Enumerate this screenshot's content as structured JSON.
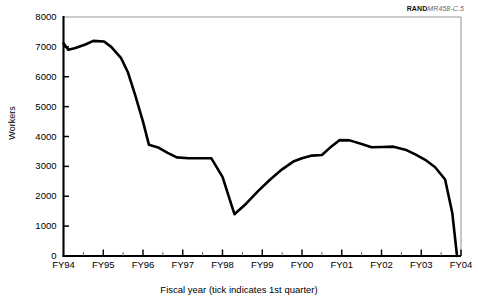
{
  "figure": {
    "source_credit_mark": "RAND",
    "source_credit_id": "MR458-C.5"
  },
  "chart_data": {
    "type": "line",
    "title": "",
    "xlabel": "Fiscal year (tick indicates 1st quarter)",
    "ylabel": "Workers",
    "xlim": [
      1994.0,
      2004.0
    ],
    "ylim": [
      0,
      8000
    ],
    "grid": false,
    "legend": null,
    "x_tick_labels": [
      "FY94",
      "FY95",
      "FY96",
      "FY97",
      "FY98",
      "FY99",
      "FY00",
      "FY01",
      "FY02",
      "FY03",
      "FY04"
    ],
    "x_tick_values": [
      1994,
      1995,
      1996,
      1997,
      1998,
      1999,
      2000,
      2001,
      2002,
      2003,
      2004
    ],
    "y_tick_labels": [
      "0",
      "1000",
      "2000",
      "3000",
      "4000",
      "5000",
      "6000",
      "7000",
      "8000"
    ],
    "y_tick_values": [
      0,
      1000,
      2000,
      3000,
      4000,
      5000,
      6000,
      7000,
      8000
    ],
    "minor_x_ticks_per_interval": 1,
    "series": [
      {
        "name": "Workers",
        "color": "#000000",
        "x": [
          1994.0,
          1994.12,
          1994.3,
          1994.55,
          1994.75,
          1995.02,
          1995.2,
          1995.45,
          1995.62,
          1995.8,
          1996.0,
          1996.15,
          1996.4,
          1996.62,
          1996.85,
          1997.15,
          1997.45,
          1997.72,
          1998.0,
          1998.3,
          1998.6,
          1998.9,
          1999.2,
          1999.5,
          1999.78,
          2000.0,
          2000.25,
          2000.5,
          2000.7,
          2000.95,
          2001.2,
          2001.5,
          2001.75,
          2002.0,
          2002.3,
          2002.6,
          2002.85,
          2003.1,
          2003.35,
          2003.6,
          2003.78,
          2003.9
        ],
        "y": [
          7120,
          6900,
          6960,
          7080,
          7200,
          7180,
          7000,
          6620,
          6150,
          5400,
          4500,
          3720,
          3620,
          3450,
          3300,
          3270,
          3270,
          3270,
          2650,
          1400,
          1760,
          2180,
          2560,
          2900,
          3160,
          3270,
          3360,
          3380,
          3620,
          3880,
          3870,
          3750,
          3640,
          3650,
          3660,
          3560,
          3400,
          3220,
          2970,
          2560,
          1450,
          0
        ]
      }
    ],
    "annotations": []
  }
}
